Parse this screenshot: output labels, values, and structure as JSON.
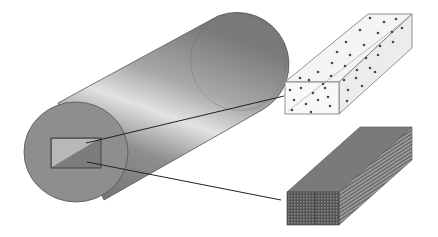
{
  "figure": {
    "components": [
      {
        "id": "cylinder",
        "label": ""
      },
      {
        "id": "section-region",
        "label": ""
      },
      {
        "id": "particle-prism",
        "label": ""
      },
      {
        "id": "layered-prism",
        "label": ""
      }
    ],
    "colors": {
      "background": "#ffffff",
      "cylinder_dark": "#6e6e6e",
      "cylinder_mid": "#9a9a9a",
      "cylinder_highlight": "#e2e2e2",
      "end_face": "#8c8c8c",
      "outline": "#3a3a3a",
      "particle": "#4a4a4a",
      "prism_light": "#f4f4f4",
      "prism_dark": "#5a5a5a"
    }
  }
}
